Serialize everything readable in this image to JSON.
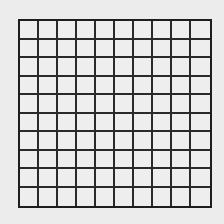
{
  "grid": {
    "rows": 10,
    "columns": 10,
    "line_color": "#222222",
    "background_color": "#ececec"
  }
}
